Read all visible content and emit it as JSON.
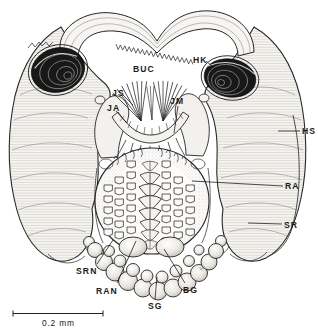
{
  "labels": {
    "buc": "BUC",
    "hk": "HK",
    "js": "JS",
    "ja": "JA",
    "jm": "JM",
    "hs": "HS",
    "ra": "RA",
    "sr": "SR",
    "srn": "SRN",
    "ran": "RAN",
    "sg": "SG",
    "bg": "BG"
  },
  "scale_bar": {
    "label": "0.2 mm"
  },
  "illustrator_mark": "60",
  "colors": {
    "ink": "#222222",
    "paper": "#ffffff",
    "coil_dark": "#181818"
  }
}
